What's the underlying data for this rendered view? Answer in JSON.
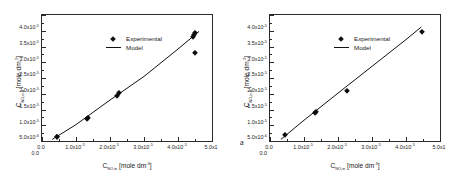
{
  "figure": {
    "panel_count": 2,
    "marker_color": "#0d0d0d",
    "line_color": "#111111",
    "axis_color": "#2b2b2b"
  },
  "legend": {
    "experimental_label": "Experimental",
    "model_label": "Model",
    "experimental_symbol": "diamond-marker",
    "model_symbol": "solid-line"
  },
  "panels": [
    {
      "tag": "a",
      "xtitle_main": "C",
      "xtitle_sub": "NO,in",
      "xtitle_unit": " [mole dm",
      "xtitle_exp": "-3",
      "xtitle_close": "]",
      "ytitle_main": "C",
      "ytitle_sub": "NO,out",
      "ytitle_unit": " [mole dm",
      "ytitle_exp": "-3",
      "ytitle_close": "]",
      "xticks": [
        "0.0",
        "1.0x10",
        "2.0x10",
        "3.0x10",
        "4.0x10",
        "5.0x1"
      ],
      "xtick_exps": [
        "",
        "-5",
        "-5",
        "-5",
        "-5",
        ""
      ],
      "yticks": [
        "0.0",
        "5.0x10",
        "1.0x10",
        "1.5x10",
        "2.0x10",
        "2.5x10",
        "3.0x10",
        "3.5x10",
        "4.0x10"
      ],
      "ytick_exps": [
        "",
        "-6",
        "-5",
        "-5",
        "-5",
        "-5",
        "-5",
        "-5",
        "-5"
      ]
    },
    {
      "tag": "b",
      "xtitle_main": "C",
      "xtitle_sub": "NO,in",
      "xtitle_unit": " [mole dm",
      "xtitle_exp": "-3",
      "xtitle_close": "]",
      "ytitle_main": "C",
      "ytitle_sub": "NO,out",
      "ytitle_unit": " [mole dm",
      "ytitle_exp": "-3",
      "ytitle_close": "]",
      "xticks": [
        "0.0",
        "1.0x10",
        "2.0x10",
        "3.0x10",
        "4.0x10",
        "5.0x1"
      ],
      "xtick_exps": [
        "",
        "-5",
        "-5",
        "-5",
        "-5",
        ""
      ],
      "yticks": [
        "0.0",
        "5.0x10",
        "1.0x10",
        "1.5x10",
        "2.0x10",
        "2.5x10",
        "3.0x10",
        "3.5x10",
        "4.0x10"
      ],
      "ytick_exps": [
        "",
        "-6",
        "-5",
        "-5",
        "-5",
        "-5",
        "-5",
        "-5",
        "-5"
      ]
    }
  ],
  "chart_data": [
    {
      "type": "scatter",
      "title": "",
      "panel": "a",
      "xlabel": "C_NO,in [mole dm^-3]",
      "ylabel": "C_NO,out [mole dm^-3]",
      "xlim": [
        0,
        5e-05
      ],
      "ylim": [
        0,
        4e-05
      ],
      "xticks": [
        0,
        1e-05,
        2e-05,
        3e-05,
        4e-05,
        5e-05
      ],
      "yticks": [
        0,
        5e-06,
        1e-05,
        1.5e-05,
        2e-05,
        2.5e-05,
        3e-05,
        3.5e-05,
        4e-05
      ],
      "grid": false,
      "legend_position": "upper-left-inside",
      "series": [
        {
          "name": "Experimental",
          "type": "scatter",
          "marker": "diamond",
          "x": [
            4.4e-06,
            4.4e-06,
            1.32e-05,
            1.35e-05,
            2.22e-05,
            2.25e-05,
            4.45e-05,
            4.47e-05,
            4.5e-05,
            4.5e-05
          ],
          "y": [
            1.2e-06,
            1.4e-06,
            7e-06,
            7.3e-06,
            1.42e-05,
            1.52e-05,
            3.3e-05,
            3.38e-05,
            3.43e-05,
            2.8e-05
          ]
        },
        {
          "name": "Model",
          "type": "line",
          "x": [
            3e-06,
            1e-05,
            2e-05,
            3e-05,
            4e-05,
            4.62e-05
          ],
          "y": [
            5e-07,
            5.2e-06,
            1.3e-05,
            2.05e-05,
            2.92e-05,
            3.48e-05
          ]
        }
      ]
    },
    {
      "type": "scatter",
      "title": "",
      "panel": "b",
      "xlabel": "C_NO,in [mole dm^-3]",
      "ylabel": "C_NO,out [mole dm^-3]",
      "xlim": [
        0,
        5e-05
      ],
      "ylim": [
        0,
        4e-05
      ],
      "xticks": [
        0,
        1e-05,
        2e-05,
        3e-05,
        4e-05,
        5e-05
      ],
      "yticks": [
        0,
        5e-06,
        1e-05,
        1.5e-05,
        2e-05,
        2.5e-05,
        3e-05,
        3.5e-05,
        4e-05
      ],
      "grid": false,
      "legend_position": "upper-left-inside",
      "series": [
        {
          "name": "Experimental",
          "type": "scatter",
          "marker": "diamond",
          "x": [
            4.5e-06,
            1.33e-05,
            1.35e-05,
            2.25e-05,
            4.47e-05
          ],
          "y": [
            1.8e-06,
            9e-06,
            9.3e-06,
            1.58e-05,
            3.47e-05
          ]
        },
        {
          "name": "Model",
          "type": "line",
          "x": [
            3.2e-06,
            1e-05,
            2e-05,
            3e-05,
            4e-05,
            4.45e-05
          ],
          "y": [
            5e-07,
            6.6e-06,
            1.52e-05,
            2.37e-05,
            3.22e-05,
            3.62e-05
          ]
        }
      ]
    }
  ]
}
